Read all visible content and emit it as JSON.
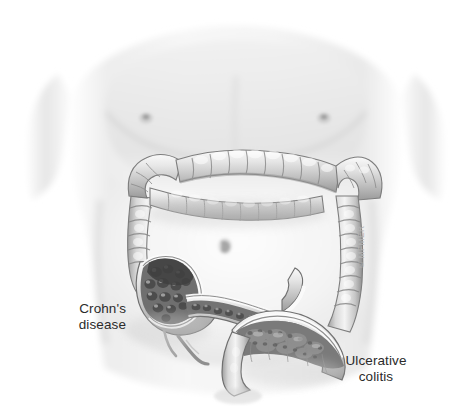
{
  "figure": {
    "background_color": "#ffffff",
    "credit": "© MFMER"
  },
  "labels": {
    "crohns": "Crohn's\ndisease",
    "ulcerative_colitis": "Ulcerative\ncolitis"
  },
  "palette": {
    "background": "#ffffff",
    "skin_light": "#f2f2f2",
    "skin_mid": "#e0e0e0",
    "skin_shadow": "#c8c8c8",
    "bowel_light": "#ededed",
    "bowel_mid": "#c9c9c9",
    "bowel_shadow": "#8f8f8f",
    "bowel_outline": "#6e6e6e",
    "lumen_dark": "#5a5a5a",
    "inflamed_dark": "#4a4a4a",
    "mucosa_mid": "#9a9a9a",
    "text": "#2b2b2b",
    "credit_text": "#b4b4b4"
  },
  "anatomy": {
    "parts": [
      {
        "name": "torso",
        "label": "Male torso, chest and abdomen"
      },
      {
        "name": "transverse-colon",
        "label": "Transverse colon"
      },
      {
        "name": "ascending-colon",
        "label": "Ascending colon"
      },
      {
        "name": "descending-colon",
        "label": "Descending colon"
      },
      {
        "name": "hepatic-flexure",
        "label": "Hepatic flexure"
      },
      {
        "name": "splenic-flexure",
        "label": "Splenic flexure"
      },
      {
        "name": "cecum",
        "label": "Cecum"
      },
      {
        "name": "terminal-ileum",
        "label": "Terminal ileum, cutaway"
      },
      {
        "name": "sigmoid-colon",
        "label": "Sigmoid colon, cutaway"
      },
      {
        "name": "rectum",
        "label": "Rectum"
      },
      {
        "name": "appendix",
        "label": "Appendix"
      }
    ]
  }
}
